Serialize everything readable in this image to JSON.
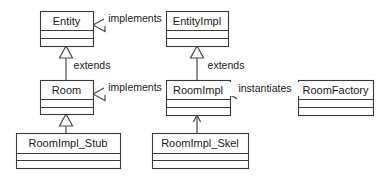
{
  "diagram": {
    "type": "uml-class-diagram",
    "background_color": "#ffffff",
    "line_color": "#4a4a4a",
    "box_stroke_color": "#3a3a3a",
    "text_color": "#1a1a1a",
    "classes": [
      {
        "id": "entity",
        "name": "Entity",
        "x": 40,
        "y": 11,
        "w": 53,
        "h": 35,
        "compartments": [
          19,
          27
        ]
      },
      {
        "id": "entity_impl",
        "name": "EntityImpl",
        "x": 166,
        "y": 11,
        "w": 62,
        "h": 35,
        "compartments": [
          19,
          27
        ]
      },
      {
        "id": "room",
        "name": "Room",
        "x": 40,
        "y": 80,
        "w": 53,
        "h": 34,
        "compartments": [
          19,
          27
        ]
      },
      {
        "id": "room_impl",
        "name": "RoomImpl",
        "x": 166,
        "y": 80,
        "w": 64,
        "h": 35,
        "compartments": [
          19,
          27
        ]
      },
      {
        "id": "room_factory",
        "name": "RoomFactory",
        "x": 298,
        "y": 80,
        "w": 75,
        "h": 35,
        "compartments": [
          19,
          27
        ]
      },
      {
        "id": "room_impl_stub",
        "name": "RoomImpl_Stub",
        "x": 16,
        "y": 133,
        "w": 104,
        "h": 35,
        "compartments": [
          20,
          27
        ]
      },
      {
        "id": "room_impl_skel",
        "name": "RoomImpl_Skel",
        "x": 152,
        "y": 133,
        "w": 96,
        "h": 35,
        "compartments": [
          20,
          27
        ]
      }
    ],
    "relationships": [
      {
        "id": "rel-entityimpl-implements-entity",
        "label": "implements",
        "from": "entity_impl",
        "to": "entity",
        "arrow": "hollow-triangle",
        "direction": "left",
        "line": {
          "x1": 166,
          "y1": 25,
          "x2": 105,
          "y2": 25
        },
        "tip": {
          "x": 93,
          "y": 25
        },
        "label_pos": {
          "x": 135,
          "y": 19
        }
      },
      {
        "id": "rel-room-extends-entity",
        "label": "extends",
        "from": "room",
        "to": "entity",
        "arrow": "hollow-triangle",
        "direction": "up",
        "line": {
          "x1": 66,
          "y1": 80,
          "x2": 66,
          "y2": 58
        },
        "tip": {
          "x": 66,
          "y": 46
        },
        "label_pos": {
          "x": 92,
          "y": 66
        }
      },
      {
        "id": "rel-roomimpl-extends-entityimpl",
        "label": "extends",
        "from": "room_impl",
        "to": "entity_impl",
        "arrow": "hollow-triangle",
        "direction": "up",
        "line": {
          "x1": 197,
          "y1": 80,
          "x2": 197,
          "y2": 58
        },
        "tip": {
          "x": 197,
          "y": 46
        },
        "label_pos": {
          "x": 226,
          "y": 66
        }
      },
      {
        "id": "rel-roomimpl-implements-room",
        "label": "implements",
        "from": "room_impl",
        "to": "room",
        "arrow": "hollow-triangle",
        "direction": "left",
        "line": {
          "x1": 166,
          "y1": 94,
          "x2": 105,
          "y2": 94
        },
        "tip": {
          "x": 93,
          "y": 94
        },
        "label_pos": {
          "x": 135,
          "y": 88
        }
      },
      {
        "id": "rel-roomfactory-instantiates-roomimpl",
        "label": "instantiates",
        "from": "room_factory",
        "to": "room_impl",
        "arrow": "open-arrow",
        "direction": "left",
        "line": {
          "x1": 298,
          "y1": 95,
          "x2": 232,
          "y2": 95
        },
        "tip": {
          "x": 230,
          "y": 95
        },
        "label_pos": {
          "x": 265,
          "y": 89
        }
      },
      {
        "id": "rel-stub-extends-room",
        "label": "",
        "from": "room_impl_stub",
        "to": "room",
        "arrow": "hollow-triangle",
        "direction": "up",
        "line": {
          "x1": 66,
          "y1": 133,
          "x2": 66,
          "y2": 124
        },
        "tip": {
          "x": 66,
          "y": 114
        },
        "label_pos": null
      },
      {
        "id": "rel-skel-uses-roomimpl",
        "label": "",
        "from": "room_impl_skel",
        "to": "room_impl",
        "arrow": "open-arrow",
        "direction": "up",
        "line": {
          "x1": 197,
          "y1": 133,
          "x2": 197,
          "y2": 117
        },
        "tip": {
          "x": 197,
          "y": 115
        },
        "label_pos": null
      }
    ]
  }
}
